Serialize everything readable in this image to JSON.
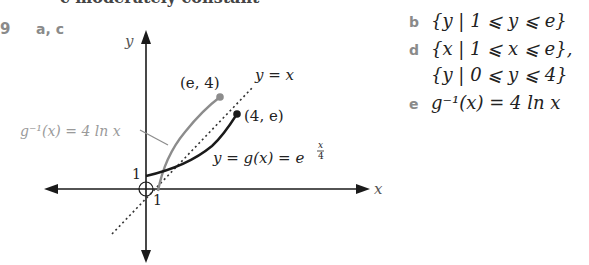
{
  "header": {
    "cut_text": "c  moderately constant"
  },
  "question": {
    "number": "9",
    "graph_parts": "a, c"
  },
  "graph": {
    "axis_x_label": "x",
    "axis_y_label": "y",
    "tick_y_1": "1",
    "tick_x_1": "1",
    "point_gray_label": "(e, 4)",
    "point_black_label": "(4, e)",
    "line_label": "y = x",
    "g_label_main": "y = g(x) = e",
    "g_label_exp_num": "x",
    "g_label_exp_den": "4",
    "ginv_label": "g⁻¹(x) = 4 ln x",
    "colors": {
      "g_curve": "#1a1a1a",
      "ginv_curve": "#8c8c8c",
      "axes": "#1a1a1a",
      "dotted_line": "#333333",
      "ginv_label": "#9a9a9a"
    }
  },
  "answers": [
    {
      "label": "b",
      "text": "{y | 1 ⩽ y ⩽ e}"
    },
    {
      "label": "d",
      "text": "{x | 1 ⩽ x ⩽ e},"
    },
    {
      "label": "",
      "text": "{y | 0 ⩽ y ⩽ 4}"
    },
    {
      "label": "e",
      "text": "g⁻¹(x) = 4 ln x"
    }
  ]
}
